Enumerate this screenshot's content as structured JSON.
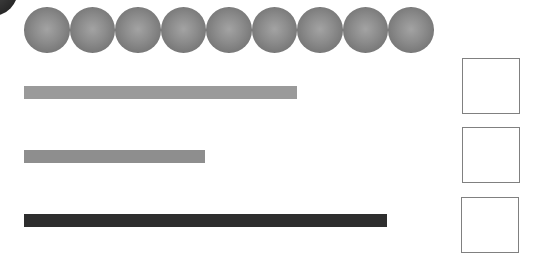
{
  "corner_disc": {
    "color": "#2a2a2a"
  },
  "balls": {
    "count": 9,
    "color_center": "#a3a3a3",
    "color_edge": "#666666",
    "items": [
      {
        "index": 1
      },
      {
        "index": 2
      },
      {
        "index": 3
      },
      {
        "index": 4
      },
      {
        "index": 5
      },
      {
        "index": 6
      },
      {
        "index": 7
      },
      {
        "index": 8
      },
      {
        "index": 9
      }
    ]
  },
  "bars": [
    {
      "index": 1,
      "width_px": 273,
      "color": "#9a9a9a"
    },
    {
      "index": 2,
      "width_px": 181,
      "color": "#8e8e8e"
    },
    {
      "index": 3,
      "width_px": 363,
      "color": "#2e2e2e"
    }
  ],
  "answer_boxes": [
    {
      "index": 1,
      "value": ""
    },
    {
      "index": 2,
      "value": ""
    },
    {
      "index": 3,
      "value": ""
    }
  ]
}
